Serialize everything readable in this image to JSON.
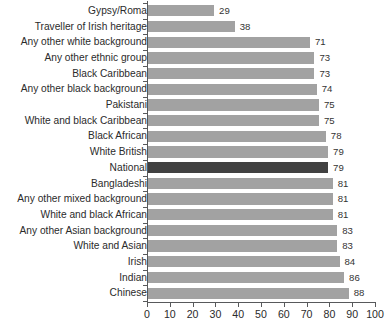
{
  "chart_data": {
    "type": "bar",
    "orientation": "horizontal",
    "title": "",
    "xlabel": "",
    "ylabel": "",
    "xlim": [
      0,
      100
    ],
    "xticks": [
      0,
      10,
      20,
      30,
      40,
      50,
      60,
      70,
      80,
      90,
      100
    ],
    "grid": false,
    "legend": null,
    "categories": [
      "Gypsy/Roma",
      "Traveller of Irish heritage",
      "Any other white background",
      "Any other ethnic group",
      "Black Caribbean",
      "Any other black background",
      "Pakistani",
      "White and black Caribbean",
      "Black African",
      "White British",
      "National",
      "Bangladeshi",
      "Any other mixed background",
      "White and black African",
      "Any other Asian background",
      "White and Asian",
      "Irish",
      "Indian",
      "Chinese"
    ],
    "values": [
      29,
      38,
      71,
      73,
      73,
      74,
      75,
      75,
      78,
      79,
      79,
      81,
      81,
      81,
      83,
      83,
      84,
      86,
      88
    ],
    "highlight_category": "National",
    "colors": {
      "bar": "#a2a2a2",
      "bar_highlight": "#414141",
      "axis": "#58595b",
      "label_text": "#2b2b2b",
      "value_text": "#333333",
      "background": "#ffffff"
    }
  }
}
